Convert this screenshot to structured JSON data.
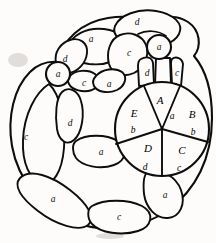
{
  "figure": {
    "background_color": "#fdfcfa",
    "ink_color": "#0d0d0d",
    "width": 216,
    "height": 243
  },
  "central_disc": {
    "name": "central-disc",
    "center_x": 162,
    "center_y": 129,
    "radius": 47,
    "sector_count": 5,
    "sectors": [
      {
        "id": "A",
        "letter": "A",
        "edge": "a",
        "position": "top",
        "letter_x": 160,
        "letter_y": 101,
        "edge_x": 172,
        "edge_y": 117
      },
      {
        "id": "B",
        "letter": "B",
        "edge": "b",
        "position": "right",
        "letter_x": 192,
        "letter_y": 115,
        "edge_x": 193,
        "edge_y": 133
      },
      {
        "id": "C",
        "letter": "C",
        "edge": "c",
        "position": "bottom-right",
        "letter_x": 182,
        "letter_y": 151,
        "edge_x": 179,
        "edge_y": 169
      },
      {
        "id": "D",
        "letter": "D",
        "edge": "d",
        "position": "bottom-left",
        "letter_x": 148,
        "letter_y": 149,
        "edge_x": 145,
        "edge_y": 168
      },
      {
        "id": "E",
        "letter": "E",
        "edge": "b",
        "position": "left",
        "letter_x": 134,
        "letter_y": 114,
        "edge_x": 133,
        "edge_y": 131
      }
    ]
  },
  "nodes": [
    {
      "name": "node-left",
      "label": "a",
      "cx": 58,
      "cy": 74,
      "r": 12
    },
    {
      "name": "node-right",
      "label": "a",
      "cx": 159,
      "cy": 47,
      "r": 12
    }
  ],
  "regions": [
    {
      "id": "r-top-d",
      "label": "d",
      "x": 137,
      "y": 23
    },
    {
      "id": "r-top-a",
      "label": "a",
      "x": 91,
      "y": 40
    },
    {
      "id": "r-upper-d",
      "label": "d",
      "x": 65,
      "y": 60
    },
    {
      "id": "r-mid-c",
      "label": "c",
      "x": 129,
      "y": 54
    },
    {
      "id": "r-node-c",
      "label": "c",
      "x": 84,
      "y": 84
    },
    {
      "id": "r-node-a",
      "label": "a",
      "x": 109,
      "y": 85
    },
    {
      "id": "r-strip-d",
      "label": "d",
      "x": 147,
      "y": 74
    },
    {
      "id": "r-strip-c",
      "label": "c",
      "x": 177,
      "y": 74
    },
    {
      "id": "r-left-c",
      "label": "c",
      "x": 26,
      "y": 138
    },
    {
      "id": "r-inner-d",
      "label": "d",
      "x": 70,
      "y": 124
    },
    {
      "id": "r-inner-a",
      "label": "a",
      "x": 101,
      "y": 153
    },
    {
      "id": "r-bottom-a",
      "label": "a",
      "x": 53,
      "y": 200
    },
    {
      "id": "r-bottom-c",
      "label": "c",
      "x": 119,
      "y": 218
    },
    {
      "id": "r-bottom-r-a",
      "label": "a",
      "x": 165,
      "y": 196
    }
  ],
  "legend": {
    "edge_labels": [
      "a",
      "b",
      "c",
      "d"
    ],
    "face_labels": [
      "A",
      "B",
      "C",
      "D",
      "E"
    ]
  }
}
